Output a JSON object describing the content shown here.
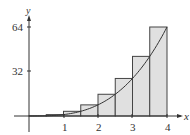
{
  "chart_data": {
    "type": "bar",
    "title": "",
    "xlabel": "x",
    "ylabel": "y",
    "function": "y = x^3",
    "rectangles": {
      "method": "right-endpoint",
      "width": 0.5,
      "x_right": [
        0.5,
        1,
        1.5,
        2,
        2.5,
        3,
        3.5,
        4
      ],
      "values": [
        0.125,
        1,
        3.375,
        8,
        15.625,
        27,
        42.875,
        64
      ]
    },
    "x_ticks": [
      "1",
      "2",
      "3",
      "4"
    ],
    "y_ticks": [
      "32",
      "64"
    ],
    "xlim": [
      0,
      4.3
    ],
    "ylim": [
      0,
      68
    ],
    "grid": false,
    "colors": {
      "fill": "#e0e0e0",
      "stroke": "#444444",
      "curve": "#333333"
    }
  },
  "labels": {
    "x_axis": "x",
    "y_axis": "y",
    "xt1": "1",
    "xt2": "2",
    "xt3": "3",
    "xt4": "4",
    "yt32": "32",
    "yt64": "64"
  }
}
